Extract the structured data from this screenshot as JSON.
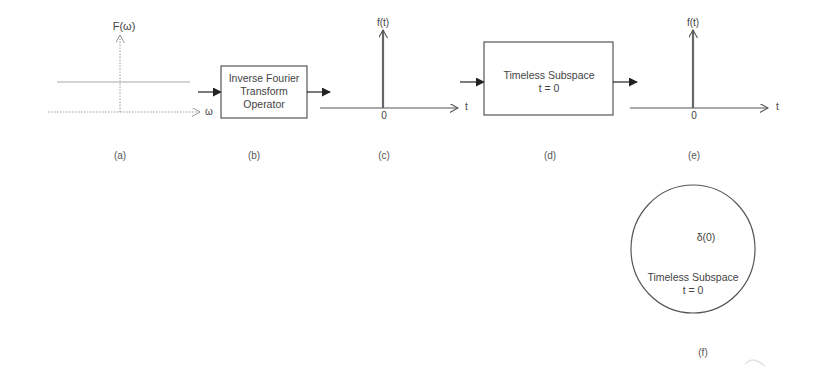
{
  "panels": {
    "a": {
      "label": "(a)",
      "y_axis_label": "F(ω)",
      "x_axis_label": "ω"
    },
    "b": {
      "label": "(b)",
      "box_lines": [
        "Inverse Fourier",
        "Transform",
        "Operator"
      ]
    },
    "c": {
      "label": "(c)",
      "y_axis_label": "f(t)",
      "x_axis_label": "t",
      "origin_label": "0"
    },
    "d": {
      "label": "(d)",
      "box_lines": [
        "Timeless Subspace",
        "t = 0"
      ]
    },
    "e": {
      "label": "(e)",
      "y_axis_label": "f(t)",
      "x_axis_label": "t",
      "origin_label": "0"
    },
    "f": {
      "label": "(f)",
      "delta_label": "δ(0)",
      "circle_lines": [
        "Timeless Subspace",
        "t = 0"
      ]
    }
  },
  "colors": {
    "line": "#555555",
    "dotted": "#9a9a9a",
    "arrow": "#222222",
    "text": "#444444"
  }
}
